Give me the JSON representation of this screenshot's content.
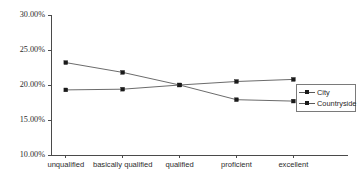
{
  "chart_data": {
    "type": "line",
    "title": "",
    "xlabel": "",
    "ylabel": "",
    "ylim": [
      10,
      30
    ],
    "ytick_labels": [
      "30.00%",
      "25.00%",
      "20.00%",
      "15.00%",
      "10.00%"
    ],
    "ytick_values": [
      30,
      25,
      20,
      15,
      10
    ],
    "grid": false,
    "legend_position": "right-middle",
    "categories": [
      "unqualified",
      "basically qualified",
      "qualified",
      "proficient",
      "excellent"
    ],
    "series": [
      {
        "name": "City",
        "values": [
          19.3,
          19.4,
          20.0,
          20.5,
          20.8
        ]
      },
      {
        "name": "Countryside",
        "values": [
          23.2,
          21.8,
          20.0,
          17.9,
          17.7
        ]
      }
    ]
  },
  "legend": {
    "items": [
      {
        "label": "City"
      },
      {
        "label": "Countryside"
      }
    ]
  }
}
